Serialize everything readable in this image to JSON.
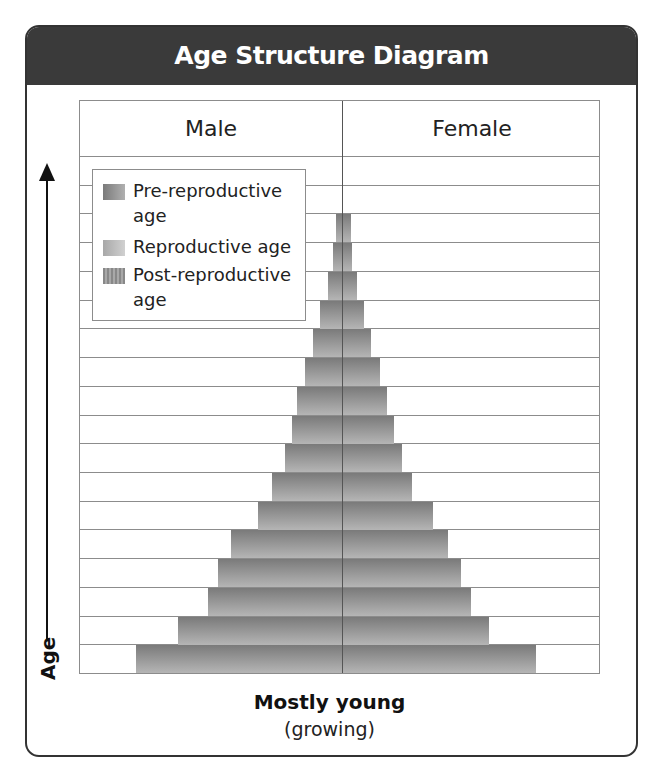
{
  "title": "Age Structure Diagram",
  "headers": {
    "male": "Male",
    "female": "Female"
  },
  "axis": {
    "y_label": "Age"
  },
  "legend": [
    {
      "label": "Pre-reproductive age",
      "color": "#8a8a8a"
    },
    {
      "label": "Reproductive age",
      "color": "#b8b8b8"
    },
    {
      "label": "Post-reproductive age",
      "color": "#9a9a9a"
    }
  ],
  "caption": {
    "main": "Mostly young",
    "sub": "(growing)"
  },
  "colors": {
    "title_bg": "#3a3a3a",
    "bar_dark": "#7a7a7a",
    "bar_light": "#b5b5b5",
    "grid": "#8c8c8c"
  },
  "chart_data": {
    "type": "bar",
    "subtype": "population-pyramid",
    "title": "Age Structure Diagram",
    "xlabel": "",
    "ylabel": "Age",
    "categories_bottom_to_top": [
      "1",
      "2",
      "3",
      "4",
      "5",
      "6",
      "7",
      "8",
      "9",
      "10",
      "11",
      "12",
      "13",
      "14",
      "15",
      "16",
      "17",
      "18"
    ],
    "series": [
      {
        "name": "Male",
        "values": [
          206,
          164,
          134,
          124,
          111,
          84,
          70,
          57,
          50,
          45,
          37,
          29,
          22,
          14,
          9,
          6,
          0,
          0
        ]
      },
      {
        "name": "Female",
        "values": [
          193,
          146,
          128,
          118,
          105,
          90,
          69,
          59,
          51,
          44,
          37,
          28,
          21,
          14,
          9,
          8,
          0,
          0
        ]
      }
    ],
    "units": "relative bar width (px)",
    "grid": true,
    "legend_position": "upper-left",
    "annotation": "Mostly young (growing)"
  }
}
